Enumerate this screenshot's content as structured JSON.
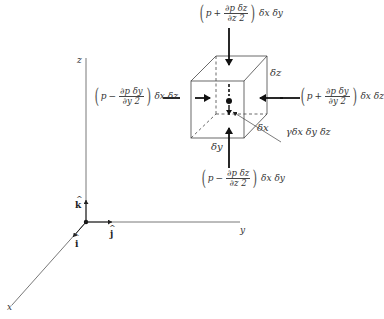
{
  "diagram": {
    "type": "fluid-element-pressure-forces",
    "axes": {
      "x_label": "x",
      "y_label": "y",
      "z_label": "z",
      "unit_vectors": {
        "i": "i",
        "j": "j",
        "k": "k",
        "hat": "^"
      }
    },
    "element": {
      "dims": {
        "dx": "δx",
        "dy": "δy",
        "dz": "δz"
      },
      "weight_label": "γδx δy δz"
    },
    "forces": {
      "top": {
        "sign": "+",
        "p": "p",
        "num": "∂p δz",
        "den": "∂z  2",
        "tail": "δx δy"
      },
      "bottom": {
        "sign": "−",
        "p": "p",
        "num": "∂p δz",
        "den": "∂z  2",
        "tail": "δx δy"
      },
      "left": {
        "sign": "−",
        "p": "p",
        "num": "∂p δy",
        "den": "∂y  2",
        "tail": "δx δz"
      },
      "right": {
        "sign": "+",
        "p": "p",
        "num": "∂p δy",
        "den": "∂y  2",
        "tail": "δx δz"
      }
    }
  }
}
